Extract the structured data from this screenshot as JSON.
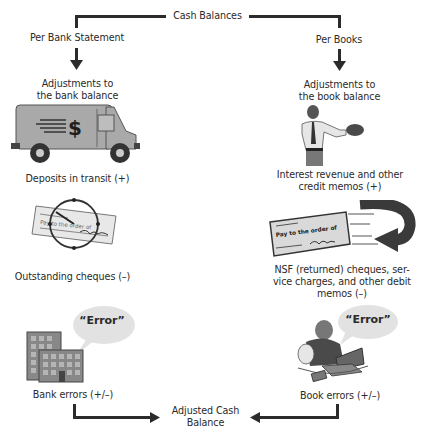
{
  "title": "Cash Balances",
  "left": {
    "heading": "Per Bank Statement",
    "adjust_line1": "Adjustments to",
    "adjust_line2": "the bank balance",
    "items": [
      {
        "label": "Deposits in transit (+)",
        "icon": "armored-truck-icon"
      },
      {
        "label": "Outstanding cheques (–)",
        "icon": "cheque-clock-icon"
      },
      {
        "label": "Bank errors (+/–)",
        "icon": "bank-building-icon",
        "bubble": "“Error”"
      }
    ]
  },
  "right": {
    "heading": "Per Books",
    "adjust_line1": "Adjustments to",
    "adjust_line2": "the book balance",
    "items": [
      {
        "label_line1": "Interest revenue and other",
        "label_line2": "credit memos (+)",
        "icon": "man-holding-money-icon"
      },
      {
        "label_line1": "NSF (returned) cheques, ser-",
        "label_line2": "vice charges, and other debit",
        "label_line3": "memos (–)",
        "icon": "returned-cheque-icon"
      },
      {
        "label": "Book errors (+/–)",
        "icon": "man-at-laptop-icon",
        "bubble": "“Error”"
      }
    ]
  },
  "result_line1": "Adjusted Cash",
  "result_line2": "Balance",
  "cheque_text": "Pay to the order of",
  "truck_symbol": "$",
  "clock_number": "12",
  "colors": {
    "line": "#2b2b2b",
    "grey_fill": "#a9a9a9",
    "bubble": "#e2e2e2"
  }
}
